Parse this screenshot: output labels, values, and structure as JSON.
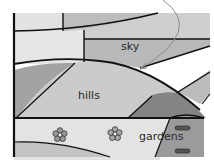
{
  "diagram": {
    "labels": {
      "sky": "sky",
      "hills": "hills",
      "gardens": "gardens"
    },
    "icons": {
      "flower": "flower-icon",
      "arrow": "curved-arrow-icon",
      "marker": "pill-marker-icon"
    },
    "colors": {
      "background": "#ffffff",
      "light_gray": "#e4e4e4",
      "mid_gray": "#c8c8c8",
      "dark_gray": "#9a9a9a",
      "darker_gray": "#7e7e7e",
      "outline": "#111111",
      "arrow": "#8c8c8c"
    }
  }
}
